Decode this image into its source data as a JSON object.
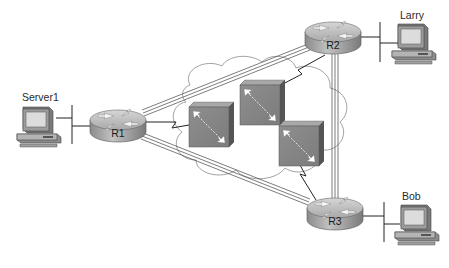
{
  "diagram": {
    "type": "network-topology",
    "nodes": {
      "server1": {
        "label": "Server1",
        "kind": "pc"
      },
      "larry": {
        "label": "Larry",
        "kind": "pc"
      },
      "bob": {
        "label": "Bob",
        "kind": "pc"
      },
      "r1": {
        "label": "R1",
        "kind": "router"
      },
      "r2": {
        "label": "R2",
        "kind": "router"
      },
      "r3": {
        "label": "R3",
        "kind": "router"
      },
      "sw1": {
        "label": "",
        "kind": "frame-relay-switch"
      },
      "sw2": {
        "label": "",
        "kind": "frame-relay-switch"
      },
      "sw3": {
        "label": "",
        "kind": "frame-relay-switch"
      }
    },
    "cloud": {
      "label": "",
      "kind": "wan-cloud"
    },
    "links": [
      {
        "from": "server1",
        "to": "r1",
        "type": "ethernet-lan"
      },
      {
        "from": "larry",
        "to": "r2",
        "type": "ethernet-lan"
      },
      {
        "from": "bob",
        "to": "r3",
        "type": "ethernet-lan"
      },
      {
        "from": "r1",
        "to": "r2",
        "type": "virtual-circuit"
      },
      {
        "from": "r1",
        "to": "r3",
        "type": "virtual-circuit"
      },
      {
        "from": "r2",
        "to": "r3",
        "type": "virtual-circuit"
      },
      {
        "from": "r1",
        "to": "sw1",
        "type": "serial"
      },
      {
        "from": "r2",
        "to": "sw2",
        "type": "serial"
      },
      {
        "from": "r3",
        "to": "sw3",
        "type": "serial"
      }
    ],
    "colors": {
      "router_body": "#9a9a9a",
      "router_top": "#c4c4c4",
      "switch_face": "#8a8a8a",
      "switch_side": "#5e5e5e",
      "pc_screen": "#d8d8d8",
      "line": "#333333"
    }
  }
}
